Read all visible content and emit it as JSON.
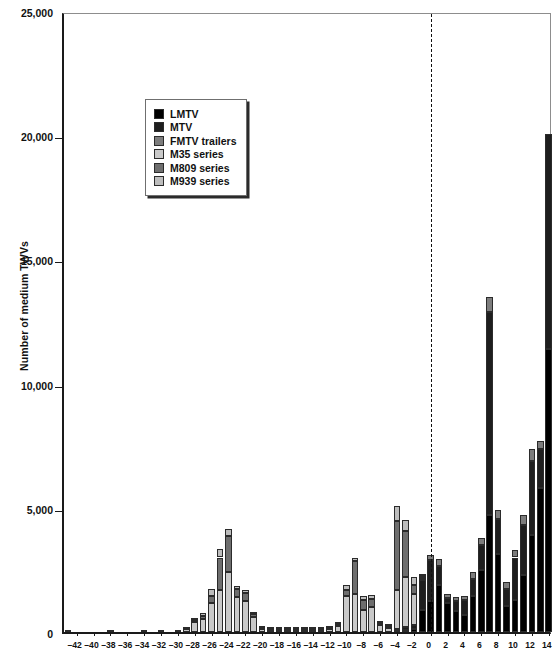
{
  "chart_data": {
    "type": "bar",
    "stacked": true,
    "title": "",
    "xlabel": "",
    "ylabel": "Number of medium TWVs",
    "ylim": [
      0,
      25000
    ],
    "ytick_values": [
      0,
      5000,
      10000,
      15000,
      20000,
      25000
    ],
    "ytick_labels": [
      "0",
      "5,000",
      "10,000",
      "15,000",
      "20,000",
      "25,000"
    ],
    "grid": false,
    "legend_position": "upper-left-inside",
    "annotations": [
      {
        "type": "vertical-dashed-line",
        "x": 0,
        "label": "0"
      }
    ],
    "xtick_labels": [
      "-42",
      "-40",
      "-38",
      "-36",
      "-34",
      "-32",
      "-30",
      "-28",
      "-26",
      "-24",
      "-22",
      "-20",
      "-18",
      "-16",
      "-14",
      "-12",
      "-10",
      "-8",
      "-6",
      "-4",
      "-2",
      "0",
      "2",
      "4",
      "6",
      "8",
      "10",
      "12",
      "14"
    ],
    "x": [
      -43,
      -42,
      -41,
      -40,
      -39,
      -38,
      -37,
      -36,
      -35,
      -34,
      -33,
      -32,
      -31,
      -30,
      -29,
      -28,
      -27,
      -26,
      -25,
      -24,
      -23,
      -22,
      -21,
      -20,
      -19,
      -18,
      -17,
      -16,
      -15,
      -14,
      -13,
      -12,
      -11,
      -10,
      -9,
      -8,
      -7,
      -6,
      -5,
      -4,
      -3,
      -2,
      -1,
      0,
      1,
      2,
      3,
      4,
      5,
      6,
      7,
      8,
      9,
      10,
      11,
      12,
      13,
      14
    ],
    "series": [
      {
        "name": "LMTV",
        "color": "#000000",
        "values": [
          0,
          0,
          0,
          0,
          0,
          0,
          0,
          0,
          0,
          0,
          0,
          0,
          0,
          0,
          0,
          0,
          0,
          0,
          0,
          0,
          0,
          0,
          0,
          0,
          0,
          0,
          0,
          0,
          0,
          0,
          0,
          0,
          0,
          0,
          0,
          0,
          0,
          0,
          0,
          50,
          90,
          120,
          900,
          1250,
          1900,
          1150,
          850,
          700,
          1450,
          2500,
          4700,
          3150,
          1050,
          1300,
          2300,
          3900,
          5800,
          11400
        ]
      },
      {
        "name": "MTV",
        "color": "#1e1e1e",
        "values": [
          0,
          0,
          0,
          0,
          0,
          0,
          0,
          0,
          0,
          0,
          0,
          0,
          0,
          0,
          0,
          0,
          0,
          0,
          0,
          0,
          0,
          0,
          0,
          0,
          0,
          0,
          0,
          0,
          0,
          0,
          0,
          0,
          0,
          0,
          0,
          0,
          0,
          0,
          0,
          60,
          120,
          180,
          1200,
          1650,
          750,
          200,
          400,
          600,
          700,
          1000,
          8200,
          1400,
          700,
          1700,
          2000,
          3000,
          1550,
          8650
        ]
      },
      {
        "name": "FMTV trailers",
        "color": "#7d7d7d",
        "values": [
          0,
          0,
          0,
          0,
          0,
          0,
          0,
          0,
          0,
          0,
          0,
          0,
          0,
          0,
          0,
          0,
          0,
          0,
          0,
          0,
          0,
          0,
          0,
          0,
          0,
          0,
          0,
          0,
          0,
          0,
          0,
          0,
          0,
          0,
          0,
          0,
          0,
          0,
          0,
          0,
          0,
          0,
          0,
          200,
          300,
          200,
          150,
          150,
          250,
          300,
          600,
          350,
          250,
          300,
          400,
          450,
          350,
          0
        ]
      },
      {
        "name": "M35 series",
        "color": "#c9c9c9",
        "values": [
          40,
          0,
          0,
          0,
          0,
          40,
          0,
          0,
          0,
          40,
          0,
          90,
          0,
          90,
          130,
          420,
          540,
          1150,
          1700,
          2400,
          1400,
          1250,
          620,
          130,
          100,
          100,
          90,
          90,
          90,
          90,
          90,
          130,
          260,
          1450,
          1550,
          900,
          1000,
          280,
          180,
          1600,
          2000,
          1250,
          80,
          0,
          0,
          0,
          0,
          0,
          0,
          0,
          0,
          0,
          0,
          0,
          0,
          0,
          0,
          0
        ]
      },
      {
        "name": "M809 series",
        "color": "#6e6e6e",
        "values": [
          0,
          0,
          0,
          0,
          0,
          0,
          0,
          0,
          0,
          0,
          0,
          0,
          0,
          0,
          30,
          80,
          110,
          300,
          1300,
          1450,
          330,
          320,
          120,
          30,
          20,
          20,
          20,
          20,
          20,
          20,
          20,
          30,
          60,
          250,
          1300,
          400,
          340,
          70,
          50,
          2750,
          1850,
          350,
          60,
          0,
          0,
          0,
          0,
          0,
          0,
          0,
          0,
          0,
          0,
          0,
          0,
          0,
          0,
          0
        ]
      },
      {
        "name": "M939 series",
        "color": "#bdbdbd",
        "values": [
          0,
          0,
          0,
          0,
          0,
          0,
          0,
          0,
          0,
          0,
          0,
          0,
          0,
          0,
          0,
          60,
          100,
          300,
          340,
          300,
          140,
          110,
          60,
          20,
          20,
          20,
          20,
          20,
          20,
          20,
          20,
          20,
          40,
          180,
          150,
          170,
          160,
          60,
          40,
          600,
          430,
          320,
          60,
          0,
          0,
          0,
          0,
          0,
          0,
          0,
          0,
          0,
          0,
          0,
          0,
          0,
          0,
          0
        ]
      }
    ]
  },
  "legend": {
    "items": [
      {
        "label": "LMTV",
        "color": "#000000"
      },
      {
        "label": "MTV",
        "color": "#1e1e1e"
      },
      {
        "label": "FMTV trailers",
        "color": "#7d7d7d"
      },
      {
        "label": "M35 series",
        "color": "#c9c9c9"
      },
      {
        "label": "M809 series",
        "color": "#6e6e6e"
      },
      {
        "label": "M939 series",
        "color": "#bdbdbd"
      }
    ]
  },
  "axes": {
    "y_title": "Number of medium TWVs",
    "zero_marker": "0"
  }
}
